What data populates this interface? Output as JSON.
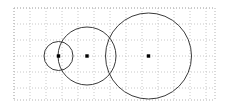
{
  "figure": {
    "canvas": {
      "width": 230,
      "height": 108,
      "background": "#ffffff"
    },
    "grid": {
      "x": 14,
      "y": 8,
      "width": 201,
      "height": 92,
      "cell_size": 16,
      "columns": 13,
      "rows": 6,
      "line_color": "#c8c8c8",
      "border_color": "#b4b4b4",
      "style": "dotted"
    },
    "stroke_color": "#3a3a3a",
    "stroke_width": 1,
    "dot_color": "#000000",
    "dot_size": 3.4,
    "circles": [
      {
        "name": "small-circle",
        "cx": 58.5,
        "cy": 56,
        "r": 14.5
      },
      {
        "name": "medium-circle",
        "cx": 87.0,
        "cy": 56,
        "r": 29.0
      },
      {
        "name": "large-circle",
        "cx": 148.5,
        "cy": 56,
        "r": 43.0
      }
    ],
    "center_dots": [
      {
        "name": "small-circle-center",
        "cx": 58.5,
        "cy": 56
      },
      {
        "name": "medium-circle-center",
        "cx": 87.0,
        "cy": 56
      },
      {
        "name": "large-circle-center",
        "cx": 148.5,
        "cy": 56
      }
    ]
  }
}
